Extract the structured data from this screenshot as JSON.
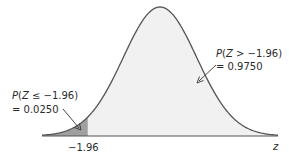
{
  "chart_data": {
    "type": "area",
    "title": "",
    "distribution": "standard normal",
    "xlabel": "z",
    "ylabel": "",
    "critical_value": -1.96,
    "critical_value_label": "-1.96",
    "regions": [
      {
        "name": "left-tail",
        "expression": "P(Z ≤ −1.96)",
        "value_label": "= 0.0250",
        "value": 0.025,
        "shade": "dark"
      },
      {
        "name": "right-body",
        "expression": "P(Z > −1.96)",
        "value_label": "= 0.9750",
        "value": 0.975,
        "shade": "light"
      }
    ],
    "xlim": [
      -3.2,
      3.2
    ],
    "grid": false,
    "legend": "none"
  },
  "labels": {
    "left_expr": "P(Z ≤ −1.96)",
    "left_value": "= 0.0250",
    "right_expr": "P(Z > −1.96)",
    "right_value": "= 0.9750",
    "tick": "−1.96",
    "axis": "z"
  },
  "colors": {
    "curve": "#555555",
    "tail_fill": "#a0a0a0",
    "body_fill": "#f1f1f1",
    "axis": "#555555",
    "text": "#2a2a2a"
  }
}
